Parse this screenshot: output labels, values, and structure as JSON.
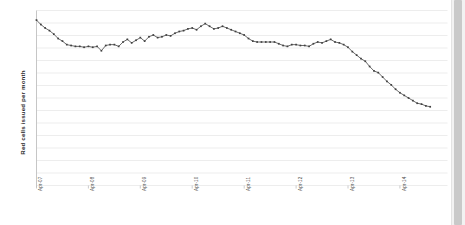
{
  "chart_data": {
    "type": "line",
    "title": "",
    "xlabel": "",
    "ylabel": "Red cells issued per month",
    "grid": true,
    "gridlines": 14,
    "legend": false,
    "marker": "square",
    "line_color": "#595959",
    "marker_color": "#404040",
    "gridline_color": "#e8e8e8",
    "axis_color": "#bfbfbf",
    "background": "#ffffff",
    "xlim": [
      "Apr-07",
      "Apr-15"
    ],
    "ylim": [
      0,
      100
    ],
    "categories": [
      "Apr-07",
      "May-07",
      "Jun-07",
      "Jul-07",
      "Aug-07",
      "Sep-07",
      "Oct-07",
      "Nov-07",
      "Dec-07",
      "Jan-08",
      "Feb-08",
      "Mar-08",
      "Apr-08",
      "May-08",
      "Jun-08",
      "Jul-08",
      "Aug-08",
      "Sep-08",
      "Oct-08",
      "Nov-08",
      "Dec-08",
      "Jan-09",
      "Feb-09",
      "Mar-09",
      "Apr-09",
      "May-09",
      "Jun-09",
      "Jul-09",
      "Aug-09",
      "Sep-09",
      "Oct-09",
      "Nov-09",
      "Dec-09",
      "Jan-10",
      "Feb-10",
      "Mar-10",
      "Apr-10",
      "May-10",
      "Jun-10",
      "Jul-10",
      "Aug-10",
      "Sep-10",
      "Oct-10",
      "Nov-10",
      "Dec-10",
      "Jan-11",
      "Feb-11",
      "Mar-11",
      "Apr-11",
      "May-11",
      "Jun-11",
      "Jul-11",
      "Aug-11",
      "Sep-11",
      "Oct-11",
      "Nov-11",
      "Dec-11",
      "Jan-12",
      "Feb-12",
      "Mar-12",
      "Apr-12",
      "May-12",
      "Jun-12",
      "Jul-12",
      "Aug-12",
      "Sep-12",
      "Oct-12",
      "Nov-12",
      "Dec-12",
      "Jan-13",
      "Feb-13",
      "Mar-13",
      "Apr-13",
      "May-13",
      "Jun-13",
      "Jul-13",
      "Aug-13",
      "Sep-13",
      "Oct-13",
      "Nov-13",
      "Dec-13",
      "Jan-14",
      "Feb-14",
      "Mar-14",
      "Apr-14",
      "May-14",
      "Jun-14",
      "Jul-14",
      "Aug-14",
      "Sep-14",
      "Oct-14",
      "Nov-14"
    ],
    "values": [
      94.5,
      92.0,
      90.0,
      88.5,
      86.5,
      84.0,
      82.5,
      80.5,
      80.0,
      79.5,
      79.5,
      79.0,
      79.5,
      79.0,
      79.5,
      77.0,
      80.0,
      80.5,
      80.5,
      79.5,
      82.0,
      83.5,
      81.5,
      83.0,
      84.5,
      82.5,
      85.0,
      86.0,
      84.5,
      85.0,
      86.0,
      85.5,
      87.0,
      88.0,
      88.5,
      89.5,
      90.0,
      89.0,
      91.0,
      92.5,
      91.0,
      89.5,
      90.0,
      91.0,
      90.0,
      89.0,
      88.0,
      87.0,
      86.0,
      84.0,
      82.5,
      82.0,
      82.0,
      82.0,
      82.0,
      82.0,
      81.0,
      80.0,
      79.5,
      80.5,
      80.5,
      80.0,
      80.0,
      79.5,
      81.0,
      82.0,
      81.5,
      82.5,
      83.5,
      82.0,
      81.5,
      80.5,
      79.0,
      76.5,
      74.5,
      72.5,
      71.0,
      68.0,
      65.5,
      64.5,
      62.0,
      59.5,
      57.5,
      55.0,
      53.0,
      51.5,
      50.0,
      48.5,
      47.0,
      46.5,
      45.5,
      45.0
    ],
    "tick_labels": [
      "Apr-07",
      "Apr-08",
      "Apr-09",
      "Apr-10",
      "Apr-11",
      "Apr-12",
      "Apr-13",
      "Apr-14"
    ],
    "tick_indices": [
      0,
      12,
      24,
      36,
      48,
      60,
      72,
      84
    ]
  },
  "scrollbar": {
    "name": "vertical-scrollbar"
  }
}
